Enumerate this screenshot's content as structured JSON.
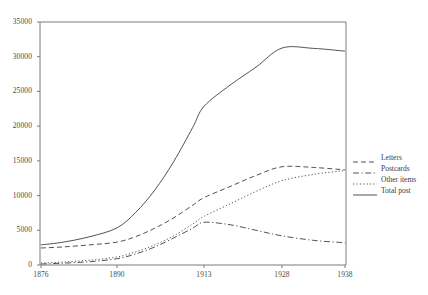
{
  "chart_data": {
    "type": "line",
    "title": "",
    "subtitle": "",
    "xlabel": "",
    "ylabel": "",
    "xlim": [
      1876,
      1938
    ],
    "ylim": [
      0,
      35000
    ],
    "grid": false,
    "legend_position": "right",
    "x_ticks": [
      "1876",
      "1890",
      "1913",
      "1928",
      "1938"
    ],
    "x_tick_values": [
      1876,
      1890,
      1913,
      1928,
      1938
    ],
    "y_ticks": [
      "0",
      "5000",
      "10000",
      "15000",
      "20000",
      "25000",
      "30000",
      "35000"
    ],
    "y_tick_values": [
      0,
      5000,
      10000,
      15000,
      20000,
      25000,
      30000,
      35000
    ],
    "x": [
      1876,
      1880,
      1885,
      1890,
      1895,
      1900,
      1905,
      1910,
      1913,
      1918,
      1923,
      1928,
      1933,
      1938
    ],
    "series": [
      {
        "name": "Letters",
        "style": "dashed",
        "color": "#404040",
        "values": [
          2450,
          2600,
          2900,
          3300,
          4100,
          5300,
          6800,
          8600,
          9700,
          11300,
          12900,
          14150,
          14050,
          13700
        ]
      },
      {
        "name": "Postcards",
        "style": "dash-dot",
        "color": "#404040",
        "values": [
          150,
          260,
          480,
          900,
          1600,
          2600,
          3900,
          5300,
          6150,
          5800,
          5000,
          4200,
          3550,
          3200
        ]
      },
      {
        "name": "Other items",
        "style": "dotted",
        "color": "#404040",
        "values": [
          300,
          420,
          700,
          1150,
          1900,
          2900,
          4200,
          5900,
          7000,
          8800,
          10600,
          12150,
          13050,
          13600
        ]
      },
      {
        "name": "Total post",
        "style": "solid",
        "color": "#404040",
        "values": [
          2900,
          3280,
          4080,
          5350,
          7600,
          10800,
          14900,
          19800,
          22850,
          25900,
          28500,
          31250,
          31200,
          30800
        ]
      }
    ]
  },
  "legend": {
    "items": [
      {
        "label": "Letters"
      },
      {
        "label": "Postcards"
      },
      {
        "label": "Other items"
      },
      {
        "label": "Total post"
      }
    ]
  }
}
